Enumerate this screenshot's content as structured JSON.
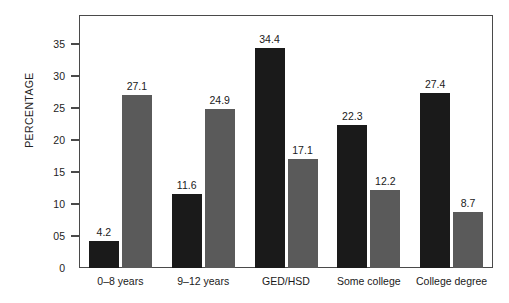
{
  "chart_data": {
    "type": "bar",
    "title": "",
    "subtitle": "",
    "xlabel": "",
    "ylabel": "PERCENTAGE",
    "categories": [
      "0–8 years",
      "9–12 years",
      "GED/HSD",
      "Some college",
      "College degree"
    ],
    "series": [
      {
        "name": "series-1",
        "color": "#1a1a1a",
        "values": [
          4.2,
          11.6,
          34.4,
          22.3,
          27.4
        ],
        "labels": [
          "4.2",
          "11.6",
          "34.4",
          "22.3",
          "27.4"
        ]
      },
      {
        "name": "series-2",
        "color": "#5a5a5a",
        "values": [
          27.1,
          24.9,
          17.1,
          12.2,
          8.7
        ],
        "labels": [
          "27.1",
          "24.9",
          "17.1",
          "12.2",
          "8.7"
        ]
      }
    ],
    "ylim": [
      0,
      36.5
    ],
    "ytick_values": [
      0,
      5,
      10,
      15,
      20,
      25,
      30,
      35
    ],
    "ytick_labels": [
      "0",
      "05",
      "10",
      "15",
      "20",
      "25",
      "30",
      "35"
    ],
    "grid": false,
    "legend": false,
    "legend_position": "none",
    "axis_color": "#4a4a4a",
    "background": "#ffffff"
  }
}
